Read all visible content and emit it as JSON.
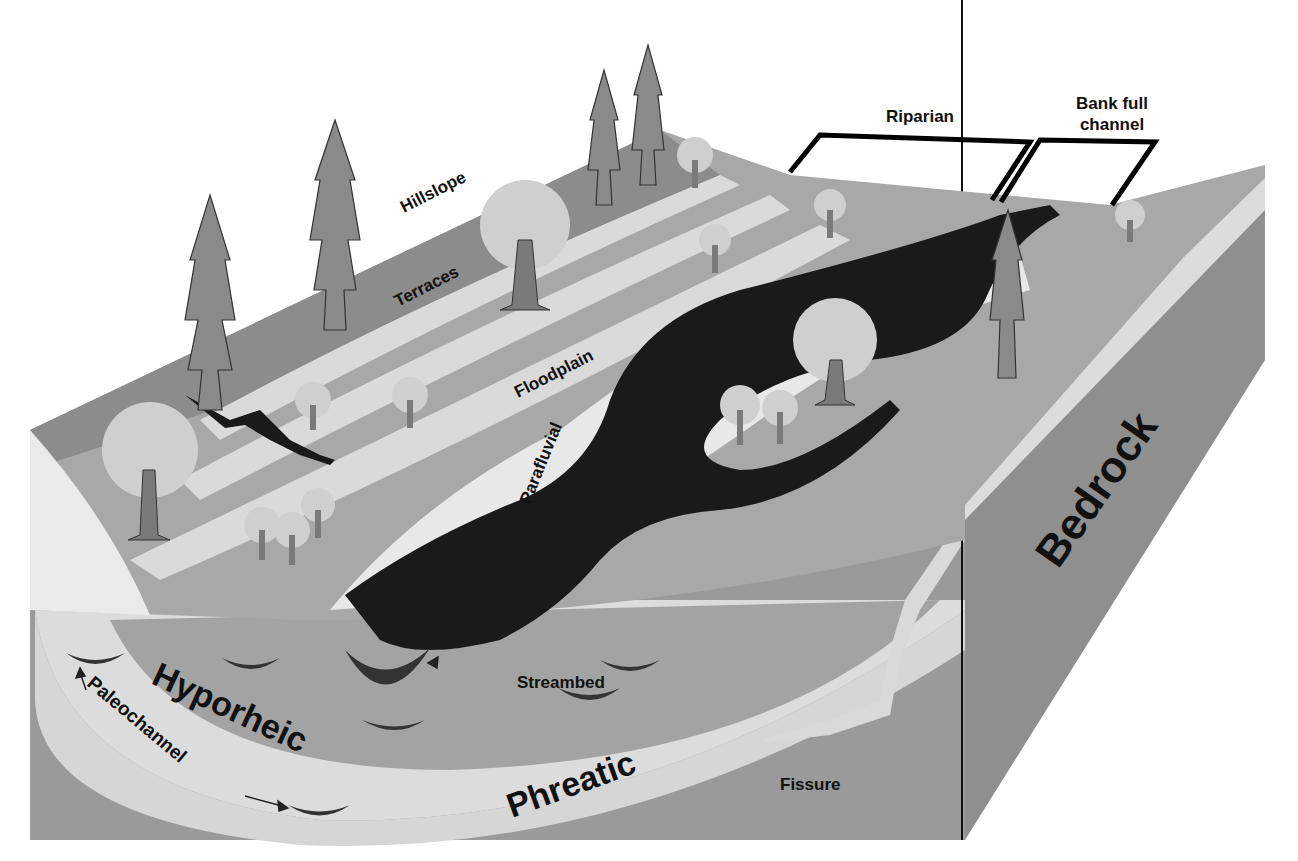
{
  "diagram": {
    "colors": {
      "background": "#ffffff",
      "hillslope": "#8c8c8c",
      "terrace_light": "#dadada",
      "floodplain": "#a8a8a8",
      "channel": "#1a1a1a",
      "hyporheic": "#9e9e9e",
      "phreatic_band": "#d6d6d6",
      "bedrock": "#8f8f8f",
      "tree_trunk": "#6e6e6e",
      "tree_crown": "#c8c8c8",
      "bracket": "#000000"
    },
    "labels": {
      "riparian": "Riparian",
      "bank_full_line1": "Bank full",
      "bank_full_line2": "channel",
      "hillslope": "Hillslope",
      "terraces": "Terraces",
      "floodplain": "Floodplain",
      "parafluvial": "Parafluvial",
      "bedrock": "Bedrock",
      "streambed": "Streambed",
      "hyporheic": "Hyporheic",
      "paleochannel": "Paleochannel",
      "phreatic": "Phreatic",
      "fissure": "Fissure"
    }
  }
}
